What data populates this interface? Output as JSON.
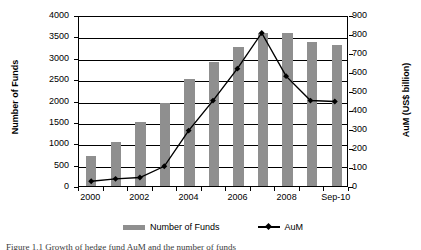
{
  "figure": {
    "caption": "Figure 1.1  Growth of hedge fund AuM and the number of funds"
  },
  "chart_data": {
    "type": "bar",
    "title": "",
    "xlabel": "",
    "categories": [
      "2000",
      "2001",
      "2002",
      "2003",
      "2004",
      "2005",
      "2006",
      "2007",
      "2008",
      "2009",
      "Sep-10"
    ],
    "visible_tick_labels": [
      "2000",
      "",
      "2002",
      "",
      "2004",
      "",
      "2006",
      "",
      "2008",
      "",
      "Sep-10"
    ],
    "grid": true,
    "legend_position": "bottom",
    "axes": {
      "left": {
        "label": "Number of Funds",
        "ticks": [
          "0",
          "500",
          "1000",
          "1500",
          "2000",
          "2500",
          "3000",
          "3500",
          "4000"
        ],
        "tick_values": [
          0,
          500,
          1000,
          1500,
          2000,
          2500,
          3000,
          3500,
          4000
        ],
        "ylim": [
          0,
          4000
        ]
      },
      "right": {
        "label": "AuM (US$ billion)",
        "ticks": [
          "0",
          "100",
          "200",
          "300",
          "400",
          "500",
          "600",
          "700",
          "800",
          "900"
        ],
        "tick_values": [
          0,
          100,
          200,
          300,
          400,
          500,
          600,
          700,
          800,
          900
        ],
        "ylim": [
          0,
          900
        ]
      }
    },
    "series": [
      {
        "name": "Number of Funds",
        "type": "bar",
        "axis": "left",
        "color": "#8f8f8f",
        "values": [
          710,
          1030,
          1500,
          1950,
          2500,
          2890,
          3260,
          3570,
          3570,
          3370,
          3300
        ]
      },
      {
        "name": "AuM",
        "type": "line",
        "axis": "right",
        "color": "#000000",
        "values": [
          25,
          38,
          45,
          105,
          295,
          455,
          625,
          815,
          585,
          455,
          450
        ]
      }
    ]
  },
  "legend": {
    "items": [
      {
        "label": "Number of Funds",
        "marker": "bar-swatch"
      },
      {
        "label": "AuM",
        "marker": "line-marker"
      }
    ]
  }
}
